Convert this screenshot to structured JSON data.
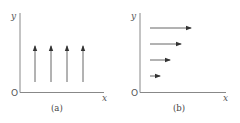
{
  "panels": [
    {
      "id": "a",
      "caption": "(a)",
      "axis_labels": {
        "x": "x",
        "y": "y",
        "origin": "O"
      },
      "description": "Four vertical arrows of equal length pointing up (+y), evenly spaced along x",
      "arrows": [
        {
          "x": 35,
          "y1": 82,
          "y2": 46
        },
        {
          "x": 51,
          "y1": 82,
          "y2": 46
        },
        {
          "x": 67,
          "y1": 82,
          "y2": 46
        },
        {
          "x": 83,
          "y1": 82,
          "y2": 46
        }
      ]
    },
    {
      "id": "b",
      "caption": "(b)",
      "axis_labels": {
        "x": "x",
        "y": "y",
        "origin": "O"
      },
      "description": "Four horizontal arrows pointing in +x, length increasing with y",
      "arrows": [
        {
          "y": 28,
          "x1": 150,
          "x2": 191
        },
        {
          "y": 44,
          "x1": 150,
          "x2": 181
        },
        {
          "y": 60,
          "x1": 150,
          "x2": 170
        },
        {
          "y": 76,
          "x1": 150,
          "x2": 160
        }
      ]
    }
  ],
  "colors": {
    "axis": "#777777",
    "arrow": "#444444",
    "text": "#555555"
  }
}
